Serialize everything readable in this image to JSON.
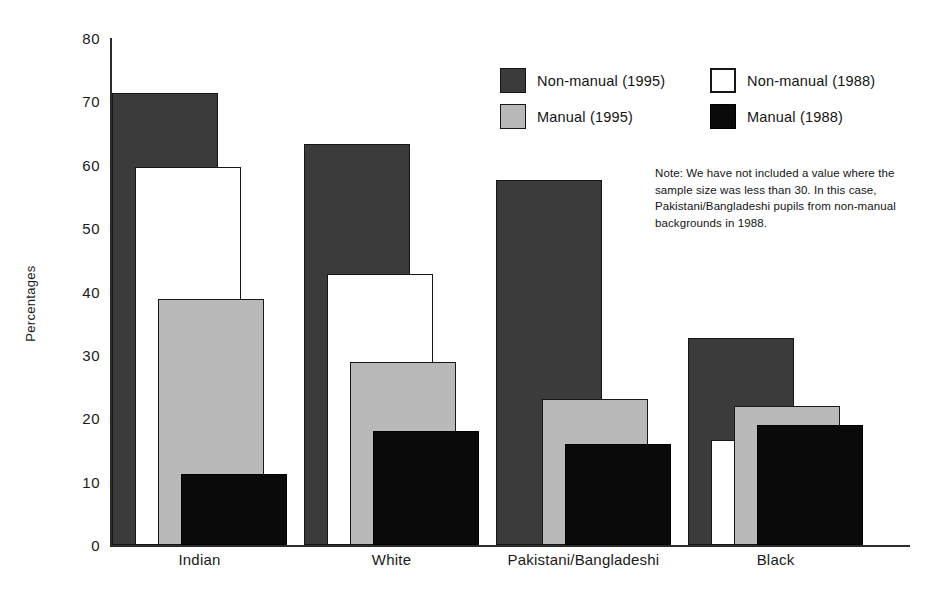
{
  "chart_data": {
    "type": "bar",
    "title": "",
    "xlabel": "",
    "ylabel": "Percentages",
    "ylim": [
      0,
      80
    ],
    "ytick_step": 10,
    "yticks": [
      "80",
      "70",
      "60",
      "50",
      "40",
      "30",
      "20",
      "10",
      "0"
    ],
    "grid": false,
    "legend_position": "top-right",
    "categories": [
      "Indian",
      "White",
      "Pakistani/Bangladeshi",
      "Black"
    ],
    "series": [
      {
        "name": "Non-manual (1995)",
        "key": "nm95",
        "color": "#3b3b3b",
        "values": [
          71.3,
          63.3,
          57.6,
          32.7
        ]
      },
      {
        "name": "Non-manual (1988)",
        "key": "nm88",
        "color": "#ffffff",
        "values": [
          59.6,
          42.7,
          null,
          16.6
        ]
      },
      {
        "name": "Manual (1995)",
        "key": "m95",
        "color": "#b9b9b9",
        "values": [
          38.8,
          28.9,
          23.0,
          22.0
        ]
      },
      {
        "name": "Manual (1988)",
        "key": "m88",
        "color": "#0a0a0a",
        "values": [
          11.2,
          18.0,
          16.0,
          19.0
        ]
      }
    ],
    "annotations": [
      "Note: We have not included a value where the sample size was less than 30. In this case, Pakistani/Bangladeshi pupils from non-manual backgrounds in 1988."
    ]
  },
  "legend": {
    "items": [
      {
        "label": "Non-manual (1995)",
        "key": "nm95"
      },
      {
        "label": "Non-manual (1988)",
        "key": "nm88"
      },
      {
        "label": "Manual (1995)",
        "key": "m95"
      },
      {
        "label": "Manual (1988)",
        "key": "m88"
      }
    ]
  },
  "note": {
    "text": "Note: We have not included a value where the sample size was less than 30. In this case, Pakistani/Bangladeshi pupils from non-manual backgrounds in 1988."
  },
  "axis": {
    "y_title": "Percentages",
    "y_labels": [
      "80",
      "70",
      "60",
      "50",
      "40",
      "30",
      "20",
      "10",
      "0"
    ],
    "x_labels": [
      "Indian",
      "White",
      "Pakistani/Bangladeshi",
      "Black"
    ]
  }
}
